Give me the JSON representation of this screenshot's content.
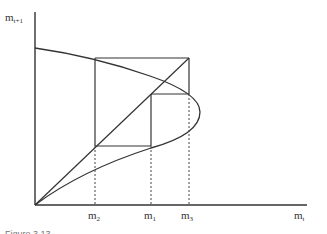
{
  "figure": {
    "y_axis_label": {
      "base": "m",
      "sub": "t+1"
    },
    "x_axis_label": {
      "base": "m",
      "sub": "t"
    },
    "tick_labels": [
      {
        "base": "m",
        "sub": "2"
      },
      {
        "base": "m",
        "sub": "1"
      },
      {
        "base": "m",
        "sub": "3"
      }
    ],
    "caption": "Figure 3.13",
    "colors": {
      "line": "#333333",
      "dotted": "#444444",
      "background": "#ffffff"
    }
  }
}
